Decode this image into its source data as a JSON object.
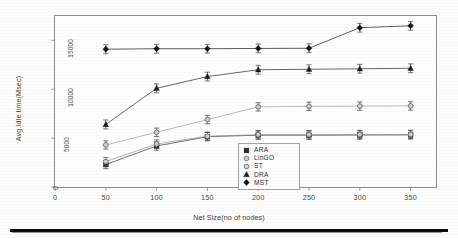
{
  "chart_data": {
    "type": "line",
    "title": "",
    "xlabel": "Net Size(no of nodes)",
    "ylabel": "Avg.Idle time(Msec)",
    "x": [
      50,
      100,
      150,
      200,
      250,
      300,
      350
    ],
    "xticks": [
      "0",
      "50",
      "100",
      "150",
      "200",
      "250",
      "300",
      "350"
    ],
    "yticks": [
      "0",
      "5000",
      "10000",
      "15000"
    ],
    "xlim": [
      0,
      375
    ],
    "ylim": [
      0,
      17500
    ],
    "grid": false,
    "legend_position": "lower-right-inside",
    "error_bars": true,
    "series": [
      {
        "name": "ARA",
        "marker": "filled-square",
        "color": "#2f2f2f",
        "values": [
          2300,
          4200,
          5150,
          5300,
          5300,
          5320,
          5330
        ],
        "errors": [
          420,
          430,
          430,
          430,
          430,
          430,
          430
        ]
      },
      {
        "name": "LinGO",
        "marker": "open-circle",
        "color": "#9a9a9a",
        "values": [
          4300,
          5600,
          6900,
          8200,
          8250,
          8280,
          8300
        ],
        "errors": [
          420,
          430,
          430,
          430,
          430,
          430,
          430
        ]
      },
      {
        "name": "ST",
        "marker": "open-circle",
        "color": "#8c8c8c",
        "values": [
          2600,
          4400,
          5200,
          5350,
          5350,
          5370,
          5380
        ],
        "errors": [
          420,
          430,
          430,
          430,
          430,
          430,
          430
        ]
      },
      {
        "name": "DRA",
        "marker": "filled-triangle",
        "color": "#1f1f1f",
        "values": [
          6400,
          10100,
          11300,
          12000,
          12050,
          12100,
          12150
        ],
        "errors": [
          460,
          450,
          450,
          450,
          450,
          450,
          450
        ]
      },
      {
        "name": "MST",
        "marker": "filled-diamond",
        "color": "#111111",
        "values": [
          14100,
          14150,
          14150,
          14180,
          14200,
          16300,
          16500
        ],
        "errors": [
          460,
          450,
          450,
          450,
          450,
          450,
          450
        ]
      }
    ]
  },
  "legend": {
    "items": [
      {
        "label": "ARA",
        "marker": "filled-square"
      },
      {
        "label": "LinGO",
        "marker": "open-circle"
      },
      {
        "label": "ST",
        "marker": "open-circle"
      },
      {
        "label": "DRA",
        "marker": "filled-triangle"
      },
      {
        "label": "MST",
        "marker": "filled-diamond"
      }
    ]
  }
}
